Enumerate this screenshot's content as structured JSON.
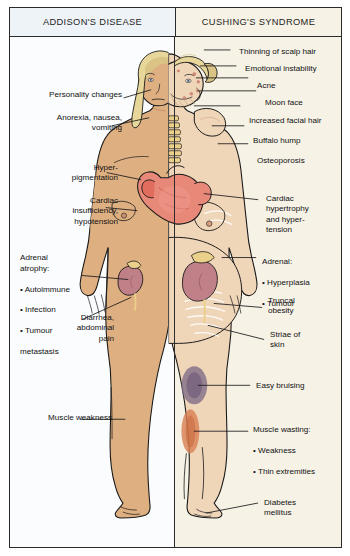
{
  "header": {
    "left": "ADDISON'S DISEASE",
    "right": "CUSHING'S SYNDROME"
  },
  "colors": {
    "panel_left_bg": "#fafcfd",
    "panel_right_bg": "#f6f2e6",
    "header_left_bg": "#eef3f7",
    "border": "#2b2b2b",
    "skin_left": "#e0b183",
    "skin_right": "#f0d6b9",
    "hair": "#e8d79a",
    "heart": "#e88878",
    "kidney": "#c08088",
    "adrenal": "#ead08a",
    "bruise": "#7d6a86",
    "muscle_wasting": "#d97c4e",
    "leader_line": "#1a1a1a"
  },
  "left_panel": {
    "name": "Addison's disease",
    "labels": [
      {
        "id": "personality-changes",
        "text": "Personality changes"
      },
      {
        "id": "anorexia-nausea-vomiting",
        "text": "Anorexia, nausea,\nvomiting"
      },
      {
        "id": "hyperpigmentation",
        "text": "Hyper-\npigmentation"
      },
      {
        "id": "cardiac-insufficiency",
        "text": "Cardiac\ninsufficiency,\nhypotension"
      },
      {
        "id": "adrenal-atrophy",
        "heading": "Adrenal\natrophy:",
        "bullets": [
          "• Autoimmune",
          "• Infection",
          "• Tumour",
          "   metastasis"
        ]
      },
      {
        "id": "diarrhea-abdominal-pain",
        "text": "Diarrhea,\nabdominal\npain"
      },
      {
        "id": "muscle-weakness",
        "text": "Muscle weakness"
      }
    ]
  },
  "right_panel": {
    "name": "Cushing's syndrome",
    "labels": [
      {
        "id": "thinning-scalp-hair",
        "text": "Thinning of scalp hair"
      },
      {
        "id": "emotional-instability",
        "text": "Emotional instability"
      },
      {
        "id": "acne",
        "text": "Acne"
      },
      {
        "id": "moon-face",
        "text": "Moon face"
      },
      {
        "id": "increased-facial-hair",
        "text": "Increased facial hair"
      },
      {
        "id": "buffalo-hump",
        "text": "Buffalo hump"
      },
      {
        "id": "osteoporosis",
        "text": "Osteoporosis"
      },
      {
        "id": "cardiac-hypertrophy",
        "text": "Cardiac\nhypertrophy\nand hyper-\ntension"
      },
      {
        "id": "adrenal",
        "heading": "Adrenal:",
        "bullets": [
          "• Hyperplasia",
          "• Tumour"
        ]
      },
      {
        "id": "truncal-obesity",
        "text": "Truncal\nobesity"
      },
      {
        "id": "striae-of-skin",
        "text": "Striae of\nskin"
      },
      {
        "id": "easy-bruising",
        "text": "Easy bruising"
      },
      {
        "id": "muscle-wasting",
        "heading": "Muscle wasting:",
        "bullets": [
          "• Weakness",
          "• Thin extremities"
        ]
      },
      {
        "id": "diabetes-mellitus",
        "text": "Diabetes\nmellitus"
      }
    ]
  }
}
